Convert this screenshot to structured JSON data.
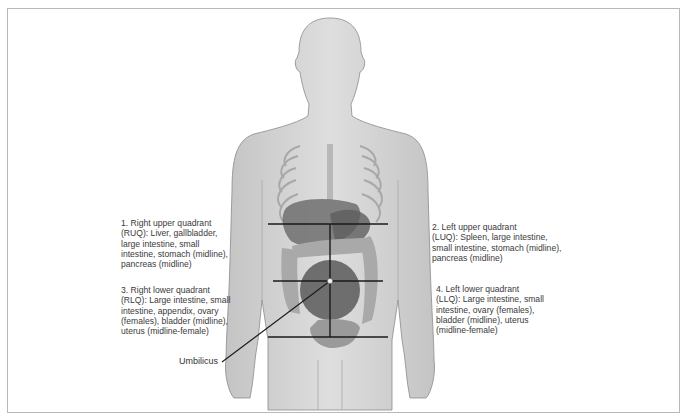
{
  "diagram": {
    "quadrants": [
      {
        "id": "ruq",
        "text": "1. Right upper quadrant\n(RUQ): Liver, gallbladder,\nlarge intestine, small\nintestine, stomach (midline),\npancreas (midline)"
      },
      {
        "id": "luq",
        "text": "2. Left upper quadrant\n(LUQ): Spleen, large intestine,\nsmall intestine, stomach (midline),\npancreas (midline)"
      },
      {
        "id": "rlq",
        "text": "3. Right lower quadrant\n(RLQ): Large intestine, small\nintestine, appendix, ovary\n(females), bladder (midline),\nuterus (midline-female)"
      },
      {
        "id": "llq",
        "text": "4. Left lower quadrant\n(LLQ): Large intestine, small\nintestine, ovary (females),\nbladder (midline), uterus\n(midline-female)"
      }
    ],
    "umbilicus_label": "Umbilicus",
    "colors": {
      "body": "#d4d4d4",
      "body_outline": "#8a8a8a",
      "organs": "#6e6e6e",
      "intestine": "#a9a9a9",
      "lines": "#1a1a1a",
      "frame": "#b8b8b8"
    }
  }
}
